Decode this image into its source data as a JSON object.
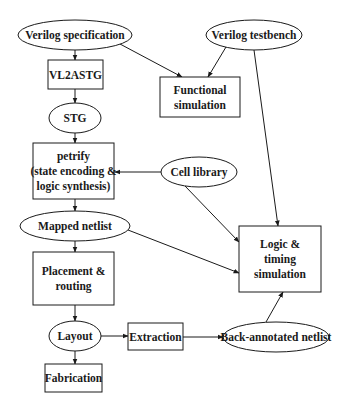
{
  "diagram": {
    "type": "flowchart",
    "nodes": {
      "verilog_spec": {
        "shape": "ellipse",
        "lines": [
          "Verilog specification"
        ]
      },
      "vl2astg": {
        "shape": "box",
        "lines": [
          "VL2ASTG"
        ]
      },
      "stg": {
        "shape": "ellipse",
        "lines": [
          "STG"
        ]
      },
      "petrify": {
        "shape": "box",
        "lines": [
          "petrify",
          "(state encoding &",
          "logic synthesis)"
        ]
      },
      "cell_library": {
        "shape": "ellipse",
        "lines": [
          "Cell library"
        ]
      },
      "mapped_netlist": {
        "shape": "ellipse",
        "lines": [
          "Mapped netlist"
        ]
      },
      "placement_routing": {
        "shape": "box",
        "lines": [
          "Placement &",
          "routing"
        ]
      },
      "layout": {
        "shape": "ellipse",
        "lines": [
          "Layout"
        ]
      },
      "extraction": {
        "shape": "box",
        "lines": [
          "Extraction"
        ]
      },
      "back_annotated": {
        "shape": "ellipse",
        "lines": [
          "Back-annotated netlist"
        ]
      },
      "fabrication": {
        "shape": "box",
        "lines": [
          "Fabrication"
        ]
      },
      "verilog_testbench": {
        "shape": "ellipse",
        "lines": [
          "Verilog testbench"
        ]
      },
      "functional_sim": {
        "shape": "box",
        "lines": [
          "Functional",
          "simulation"
        ]
      },
      "logic_timing_sim": {
        "shape": "box",
        "lines": [
          "Logic &",
          "timing",
          "simulation"
        ]
      }
    },
    "edges": [
      {
        "from": "verilog_spec",
        "to": "vl2astg"
      },
      {
        "from": "vl2astg",
        "to": "stg"
      },
      {
        "from": "stg",
        "to": "petrify"
      },
      {
        "from": "petrify",
        "to": "mapped_netlist"
      },
      {
        "from": "cell_library",
        "to": "petrify"
      },
      {
        "from": "cell_library",
        "to": "logic_timing_sim"
      },
      {
        "from": "mapped_netlist",
        "to": "placement_routing"
      },
      {
        "from": "mapped_netlist",
        "to": "logic_timing_sim"
      },
      {
        "from": "placement_routing",
        "to": "layout"
      },
      {
        "from": "layout",
        "to": "fabrication"
      },
      {
        "from": "layout",
        "to": "extraction"
      },
      {
        "from": "extraction",
        "to": "back_annotated"
      },
      {
        "from": "back_annotated",
        "to": "logic_timing_sim"
      },
      {
        "from": "verilog_spec",
        "to": "functional_sim"
      },
      {
        "from": "verilog_testbench",
        "to": "functional_sim"
      },
      {
        "from": "verilog_testbench",
        "to": "logic_timing_sim"
      }
    ]
  }
}
